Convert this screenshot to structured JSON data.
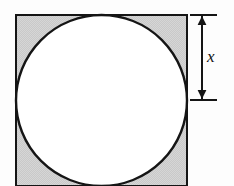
{
  "figure": {
    "background_color": "#fdfdfd",
    "square": {
      "name": "outer-square",
      "x": 16,
      "y": 15,
      "side": 171,
      "fill_color": "#c9c9c9",
      "stroke_color": "#151515",
      "stroke_width": 2.4
    },
    "circle": {
      "name": "inscribed-circle",
      "cx": 101.5,
      "cy": 100.5,
      "r": 85.5,
      "fill_color": "#ffffff",
      "stroke_color": "#151515",
      "stroke_width": 2.4
    },
    "dimension": {
      "name": "vertical-dimension-x",
      "label": "x",
      "line_x": 202,
      "y_top": 15,
      "y_bottom": 100,
      "tick_x_start": 190,
      "tick_x_end": 217,
      "stroke_color": "#151515",
      "label_x": 207,
      "label_y": 62,
      "measures": "radius"
    }
  }
}
